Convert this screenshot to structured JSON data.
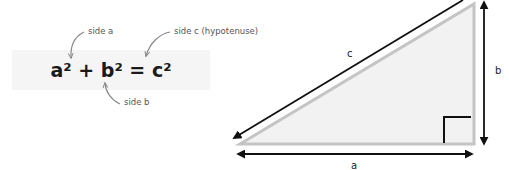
{
  "formula": {
    "text": "a² + b² = c²",
    "parts": [
      "a²",
      " + ",
      "b²",
      " = ",
      "c²"
    ]
  },
  "annotations": {
    "side_a": "side a",
    "side_b": "side b",
    "side_c": "side c (hypotenuse)"
  },
  "triangle": {
    "label_a": "a",
    "label_b": "b",
    "label_c": "c",
    "right_angle_marker": true
  },
  "colors": {
    "formula_background": "#f5f5f5",
    "triangle_fill": "#f2f2f2",
    "triangle_stroke": "#c4c4c4",
    "arrow": "#111111",
    "annotation_arrow": "#888888",
    "annotation_text": "#555555"
  }
}
